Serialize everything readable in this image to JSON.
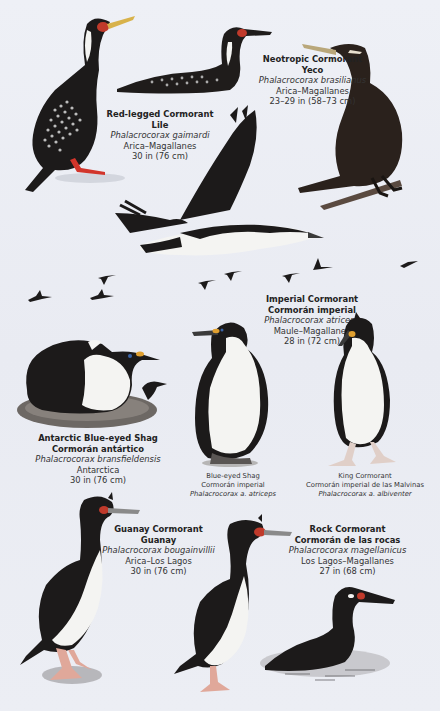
{
  "plate": {
    "background": "#eceef4",
    "species": [
      {
        "id": "red-legged",
        "common_en": "Red-legged Cormorant",
        "common_es": "Lile",
        "scientific": "Phalacrocorax gaimardi",
        "range": "Arica–Magallanes",
        "size": "30 in (76 cm)"
      },
      {
        "id": "neotropic",
        "common_en": "Neotropic Cormorant",
        "common_es": "Yeco",
        "scientific": "Phalacrocorax brasilianus",
        "range": "Arica–Magallanes",
        "size": "23–29 in (58–73 cm)"
      },
      {
        "id": "imperial",
        "common_en": "Imperial Cormorant",
        "common_es": "Cormorán imperial",
        "scientific": "Phalacrocorax atriceps",
        "range": "Maule–Magallanes",
        "size": "28 in (72 cm)"
      },
      {
        "id": "antarctic",
        "common_en": "Antarctic Blue-eyed Shag",
        "common_es": "Cormorán antártico",
        "scientific": "Phalacrocorax bransfieldensis",
        "range": "Antarctica",
        "size": "30 in (76 cm)"
      },
      {
        "id": "guanay",
        "common_en": "Guanay Cormorant",
        "common_es": "Guanay",
        "scientific": "Phalacrocorax bougainvillii",
        "range": "Arica–Los Lagos",
        "size": "30 in (76 cm)"
      },
      {
        "id": "rock",
        "common_en": "Rock Cormorant",
        "common_es": "Cormorán de las rocas",
        "scientific": "Phalacrocorax magellanicus",
        "range": "Los Lagos–Magallanes",
        "size": "27 in (68 cm)"
      }
    ],
    "subcaptions": [
      {
        "id": "blue-eyed",
        "common_en": "Blue-eyed Shag",
        "common_es": "Cormorán imperial",
        "scientific": "Phalacrocorax a. atriceps"
      },
      {
        "id": "king",
        "common_en": "King Cormorant",
        "common_es": "Cormorán imperial de las Malvinas",
        "scientific": "Phalacrocorax a. albiventer"
      }
    ],
    "colors": {
      "plumage_dark": "#1c1a1a",
      "plumage_brown": "#2a211c",
      "belly_white": "#f4f4f2",
      "red_legs": "#d2352b",
      "face_red": "#c03a2b",
      "bill_yellow": "#d8b24a",
      "caruncle_orange": "#e0a030",
      "pink_feet": "#e0a89a"
    }
  }
}
